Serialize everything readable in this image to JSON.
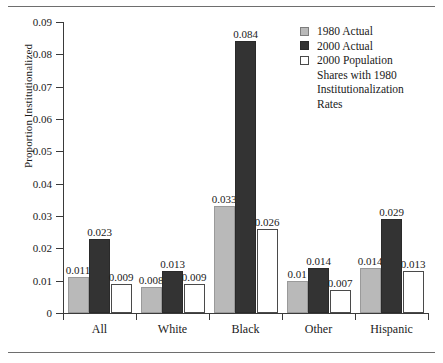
{
  "chart_data": {
    "type": "bar",
    "title": "",
    "xlabel": "",
    "ylabel": "Proportion Institutionalized",
    "categories": [
      "All",
      "White",
      "Black",
      "Other",
      "Hispanic"
    ],
    "ylim": [
      0,
      0.09
    ],
    "yticks": [
      "0",
      "0.01",
      "0.02",
      "0.03",
      "0.04",
      "0.05",
      "0.06",
      "0.07",
      "0.08",
      "0.09"
    ],
    "ytick_values": [
      0,
      0.01,
      0.02,
      0.03,
      0.04,
      0.05,
      0.06,
      0.07,
      0.08,
      0.09
    ],
    "grid": false,
    "legend_position": "top-right",
    "series": [
      {
        "name": "1980 Actual",
        "color": "#b9b9b9",
        "values": [
          0.011,
          0.008,
          0.033,
          0.01,
          0.014
        ],
        "labels": [
          "0.011",
          "0.008",
          "0.033",
          "0.01",
          "0.014"
        ]
      },
      {
        "name": "2000 Actual",
        "color": "#333333",
        "values": [
          0.023,
          0.013,
          0.084,
          0.014,
          0.029
        ],
        "labels": [
          "0.023",
          "0.013",
          "0.084",
          "0.014",
          "0.029"
        ]
      },
      {
        "name": "2000 Population Shares with 1980 Institutionalization Rates",
        "color": "#ffffff",
        "values": [
          0.009,
          0.009,
          0.026,
          0.007,
          0.013
        ],
        "labels": [
          "0.009",
          "0.009",
          "0.026",
          "0.007",
          "0.013"
        ]
      }
    ]
  },
  "legend": {
    "entries": [
      {
        "label": "1980 Actual",
        "swatch": "s0"
      },
      {
        "label": "2000 Actual",
        "swatch": "s1"
      },
      {
        "label": "2000 Population",
        "swatch": "s2"
      }
    ],
    "continuation": [
      "Shares with 1980",
      "Institutionalization",
      "Rates"
    ]
  }
}
